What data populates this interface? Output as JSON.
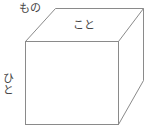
{
  "diagram": {
    "type": "cube",
    "labels": {
      "back_face": "もの",
      "top_face": "こと",
      "left_face": "ひと"
    },
    "colors": {
      "stroke": "#888888",
      "text": "#444444",
      "background": "#ffffff"
    }
  }
}
